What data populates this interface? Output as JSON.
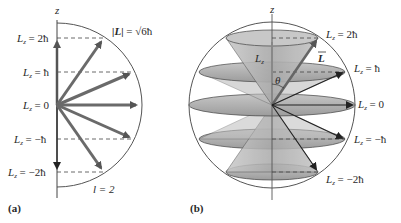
{
  "panel_a": {
    "axis_label": "z",
    "magnitude_label": "|L| = √6ħ",
    "magnitude_parts": {
      "lhs": "|L|",
      "eq": " = ",
      "root": "√6ħ"
    },
    "levels": [
      {
        "label": "L",
        "sub": "z",
        "rhs": " = 2ħ"
      },
      {
        "label": "L",
        "sub": "z",
        "rhs": " = ħ"
      },
      {
        "label": "L",
        "sub": "z",
        "rhs": " = 0"
      },
      {
        "label": "L",
        "sub": "z",
        "rhs": " = −ħ"
      },
      {
        "label": "L",
        "sub": "z",
        "rhs": " = −2ħ"
      }
    ],
    "quantum_number": "l = 2",
    "panel_label": "(a)"
  },
  "panel_b": {
    "axis_label": "z",
    "lz_label": "L",
    "lz_sub": "z",
    "vector_label": "L",
    "angle_label": "θ",
    "levels": [
      {
        "label": "L",
        "sub": "z",
        "rhs": " = 2ħ"
      },
      {
        "label": "L",
        "sub": "z",
        "rhs": " = ħ"
      },
      {
        "label": "L",
        "sub": "z",
        "rhs": " = 0"
      },
      {
        "label": "L",
        "sub": "z",
        "rhs": " = −ħ"
      },
      {
        "label": "L",
        "sub": "z",
        "rhs": " = −2ħ"
      }
    ],
    "panel_label": "(b)"
  },
  "colors": {
    "arrow_fill": "#707070",
    "arrow_stroke": "#3a3a3a",
    "cone_fill": "#b8b8b8",
    "ellipse_fill": "#a8a8a8",
    "line": "#444444"
  }
}
